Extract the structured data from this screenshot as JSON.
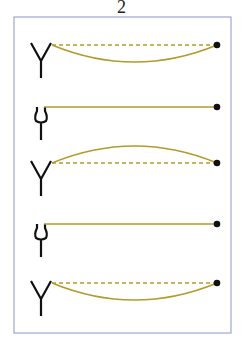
{
  "figure": {
    "label": "2",
    "colors": {
      "frame": "#8a96c8",
      "wave": "#b39a2c",
      "dashed": "#b39a2c",
      "fork": "#111111",
      "dot": "#111111"
    },
    "rows": [
      {
        "fork": "open-wide",
        "string": "dashed-rest",
        "curve": "sag-down"
      },
      {
        "fork": "narrow",
        "string": "solid-taut",
        "curve": "none"
      },
      {
        "fork": "open-wide",
        "string": "dashed-rest",
        "curve": "bow-up"
      },
      {
        "fork": "narrow",
        "string": "solid-taut",
        "curve": "none"
      },
      {
        "fork": "open-wide",
        "string": "dashed-rest",
        "curve": "sag-down"
      }
    ]
  }
}
